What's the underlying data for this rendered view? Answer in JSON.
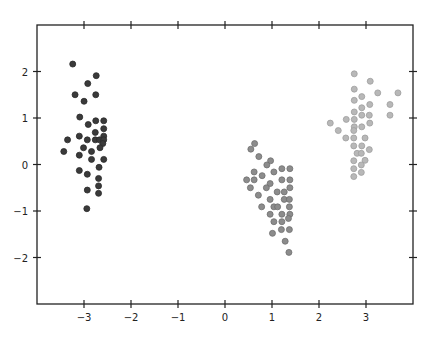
{
  "chart_data": {
    "type": "scatter",
    "title": "",
    "xlabel": "",
    "ylabel": "",
    "xlim": [
      -4,
      4
    ],
    "ylim": [
      -3,
      3
    ],
    "grid": false,
    "legend": null,
    "x_ticks": [
      -3,
      -2,
      -1,
      0,
      1,
      2,
      3
    ],
    "x_tick_labels": [
      "−3",
      "−2",
      "−1",
      "0",
      "1",
      "2",
      "3"
    ],
    "y_ticks": [
      -2,
      -1,
      0,
      1,
      2
    ],
    "y_tick_labels": [
      "−2",
      "−1",
      "0",
      "1",
      "2"
    ],
    "series": [
      {
        "name": "cluster-1",
        "color": "#3a3a3a",
        "edge": "#2a2a2a",
        "points": [
          [
            -3.24,
            2.16
          ],
          [
            -2.74,
            1.91
          ],
          [
            -2.92,
            1.74
          ],
          [
            -3.19,
            1.5
          ],
          [
            -2.75,
            1.5
          ],
          [
            -2.999,
            1.36
          ],
          [
            -3.09,
            1.02
          ],
          [
            -2.75,
            0.94
          ],
          [
            -2.58,
            0.94
          ],
          [
            -2.91,
            0.86
          ],
          [
            -2.58,
            0.77
          ],
          [
            -2.76,
            0.69
          ],
          [
            -2.58,
            0.61
          ],
          [
            -3.35,
            0.53
          ],
          [
            -3.1,
            0.61
          ],
          [
            -2.93,
            0.53
          ],
          [
            -2.76,
            0.53
          ],
          [
            -2.67,
            0.53
          ],
          [
            -2.58,
            0.53
          ],
          [
            -2.6,
            0.45
          ],
          [
            -2.66,
            0.36
          ],
          [
            -3.01,
            0.36
          ],
          [
            -3.43,
            0.28
          ],
          [
            -2.84,
            0.28
          ],
          [
            -3.1,
            0.2
          ],
          [
            -2.84,
            0.11
          ],
          [
            -2.58,
            0.11
          ],
          [
            -2.68,
            -0.06
          ],
          [
            -3.1,
            -0.13
          ],
          [
            -2.93,
            -0.21
          ],
          [
            -2.69,
            -0.3
          ],
          [
            -2.69,
            -0.46
          ],
          [
            -2.93,
            -0.55
          ],
          [
            -2.69,
            -0.62
          ],
          [
            -2.94,
            -0.95
          ]
        ]
      },
      {
        "name": "cluster-2",
        "color": "#8c8c8c",
        "edge": "#6e6e6e",
        "points": [
          [
            0.63,
            0.45
          ],
          [
            0.55,
            0.33
          ],
          [
            0.72,
            0.17
          ],
          [
            0.97,
            0.08
          ],
          [
            0.89,
            -0.01
          ],
          [
            1.21,
            -0.09
          ],
          [
            1.38,
            -0.09
          ],
          [
            0.62,
            -0.16
          ],
          [
            1.04,
            -0.16
          ],
          [
            0.79,
            -0.24
          ],
          [
            0.46,
            -0.33
          ],
          [
            0.62,
            -0.33
          ],
          [
            1.21,
            -0.33
          ],
          [
            1.38,
            -0.33
          ],
          [
            0.96,
            -0.41
          ],
          [
            0.88,
            -0.5
          ],
          [
            0.54,
            -0.5
          ],
          [
            1.38,
            -0.5
          ],
          [
            1.11,
            -0.59
          ],
          [
            1.26,
            -0.59
          ],
          [
            0.71,
            -0.66
          ],
          [
            0.96,
            -0.75
          ],
          [
            1.26,
            -0.75
          ],
          [
            1.37,
            -0.75
          ],
          [
            0.78,
            -0.91
          ],
          [
            1.04,
            -0.91
          ],
          [
            1.12,
            -0.91
          ],
          [
            1.37,
            -0.91
          ],
          [
            0.96,
            -1.07
          ],
          [
            1.21,
            -1.07
          ],
          [
            1.38,
            -1.07
          ],
          [
            1.35,
            -1.16
          ],
          [
            1.04,
            -1.23
          ],
          [
            1.21,
            -1.23
          ],
          [
            1.2,
            -1.4
          ],
          [
            1.37,
            -1.4
          ],
          [
            1.01,
            -1.48
          ],
          [
            1.28,
            -1.65
          ],
          [
            1.36,
            -1.89
          ]
        ]
      },
      {
        "name": "cluster-3",
        "color": "#b8b8b8",
        "edge": "#9e9e9e",
        "points": [
          [
            2.75,
            1.95
          ],
          [
            3.09,
            1.79
          ],
          [
            2.75,
            1.62
          ],
          [
            3.25,
            1.54
          ],
          [
            3.68,
            1.54
          ],
          [
            2.91,
            1.46
          ],
          [
            2.75,
            1.38
          ],
          [
            3.08,
            1.29
          ],
          [
            3.51,
            1.29
          ],
          [
            2.91,
            1.22
          ],
          [
            2.75,
            1.13
          ],
          [
            2.91,
            1.06
          ],
          [
            3.07,
            1.06
          ],
          [
            3.51,
            1.06
          ],
          [
            2.58,
            0.97
          ],
          [
            2.75,
            0.97
          ],
          [
            2.24,
            0.89
          ],
          [
            3.08,
            0.89
          ],
          [
            2.75,
            0.81
          ],
          [
            2.91,
            0.81
          ],
          [
            2.74,
            0.73
          ],
          [
            2.41,
            0.73
          ],
          [
            2.57,
            0.57
          ],
          [
            2.74,
            0.57
          ],
          [
            2.98,
            0.57
          ],
          [
            2.74,
            0.4
          ],
          [
            2.91,
            0.4
          ],
          [
            3.07,
            0.32
          ],
          [
            2.81,
            0.24
          ],
          [
            2.9,
            0.24
          ],
          [
            2.74,
            0.08
          ],
          [
            2.98,
            0.09
          ],
          [
            2.9,
            -0.01
          ],
          [
            2.74,
            -0.09
          ],
          [
            2.9,
            -0.17
          ],
          [
            2.74,
            -0.26
          ]
        ]
      }
    ]
  }
}
